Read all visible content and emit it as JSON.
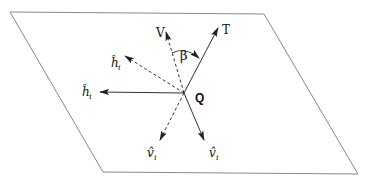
{
  "diagram": {
    "type": "vector-plane-diagram",
    "plane": {
      "corners": [
        [
          10,
          12
        ],
        [
          264,
          14
        ],
        [
          358,
          174
        ],
        [
          103,
          172
        ]
      ],
      "stroke": "#7a7a7a"
    },
    "origin": {
      "label": "Q",
      "x": 184,
      "y": 93
    },
    "vectors": [
      {
        "id": "V",
        "label": "V",
        "tip": [
          166,
          32
        ],
        "style": "dashed",
        "label_pos": [
          157,
          20
        ]
      },
      {
        "id": "T",
        "label": "T",
        "tip": [
          218,
          28
        ],
        "style": "solid",
        "label_pos": [
          225,
          22
        ]
      },
      {
        "id": "h_prime",
        "label": "ĥ",
        "sub": "i",
        "prime": true,
        "tip": [
          125,
          56
        ],
        "style": "dashed",
        "label_pos": [
          110,
          60
        ]
      },
      {
        "id": "h",
        "label": "ĥ",
        "sub": "i",
        "prime": false,
        "tip": [
          100,
          92
        ],
        "style": "solid",
        "label_pos": [
          82,
          97
        ]
      },
      {
        "id": "v_prime",
        "label": "v̂",
        "sub": "i",
        "prime": true,
        "tip": [
          160,
          140
        ],
        "style": "dashed",
        "label_pos": [
          148,
          158
        ]
      },
      {
        "id": "v",
        "label": "v̂",
        "sub": "i",
        "prime": false,
        "tip": [
          204,
          140
        ],
        "style": "solid",
        "label_pos": [
          210,
          158
        ]
      }
    ],
    "angle": {
      "label": "β",
      "between": [
        "V",
        "T"
      ],
      "label_pos": [
        185,
        44
      ]
    },
    "colors": {
      "line": "#333333",
      "plane": "#7a7a7a",
      "text": "#111111"
    }
  }
}
